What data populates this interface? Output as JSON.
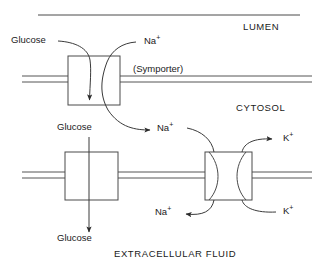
{
  "figure": {
    "title_caption": "EXTRACELLULAR FLUID",
    "compartments": {
      "lumen": "LUMEN",
      "cytosol": "CYTOSOL",
      "extracellular": "EXTRACELLULAR FLUID"
    },
    "annotations": {
      "symporter": "(Symporter)"
    },
    "labels": {
      "glucose_lumen": "Glucose",
      "glucose_cytosol": "Glucose",
      "glucose_extracellular": "Glucose",
      "sodium_lumen": "Na",
      "sodium_cytosol": "Na",
      "sodium_extracellular": "Na",
      "potassium_extracellular": "K",
      "potassium_cytosol": "K",
      "plus_charge": "+"
    },
    "colors": {
      "stroke": "#2b2b2b",
      "membrane": "#555555",
      "text": "#1a1a1a",
      "background": "#ffffff"
    },
    "transporters": [
      {
        "name": "sodium-glucose-symporter",
        "type": "symporter",
        "substrates": [
          "Glucose",
          "Na+"
        ],
        "membrane": "apical"
      },
      {
        "name": "glucose-uniporter",
        "type": "uniporter",
        "substrates": [
          "Glucose"
        ],
        "membrane": "basolateral"
      },
      {
        "name": "sodium-potassium-pump",
        "type": "antiporter-pump",
        "substrates": [
          "Na+",
          "K+"
        ],
        "membrane": "basolateral"
      }
    ]
  }
}
